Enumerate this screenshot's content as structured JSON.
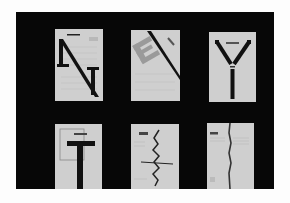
{
  "image": {
    "description": "Photograph of six typographic posters arranged in a 2x3 grid on a black board",
    "background_color": "#070707",
    "panel_color": "#cfcfcf",
    "ink_color": "#111111"
  },
  "panels": [
    {
      "row": 1,
      "col": 1,
      "motif": "letter N"
    },
    {
      "row": 1,
      "col": 2,
      "motif": "letter E with diagonal bar"
    },
    {
      "row": 1,
      "col": 3,
      "motif": "letter Y"
    },
    {
      "row": 2,
      "col": 1,
      "motif": "letter T"
    },
    {
      "row": 2,
      "col": 2,
      "motif": "zigzag line"
    },
    {
      "row": 2,
      "col": 3,
      "motif": "vertical line"
    }
  ]
}
